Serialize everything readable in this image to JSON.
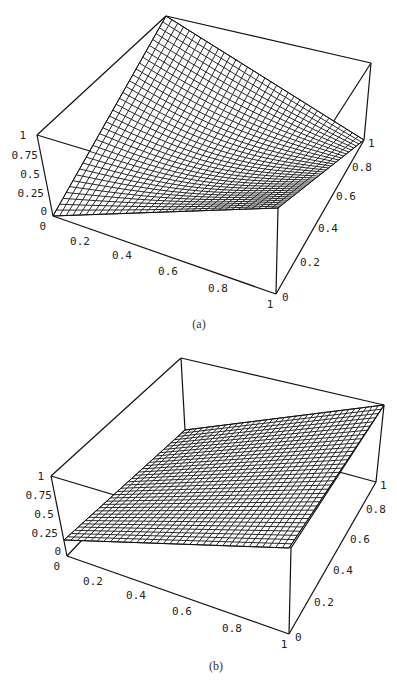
{
  "figure": {
    "panels": [
      {
        "caption": "(a)",
        "z_ticks": [
          "1",
          "0.75",
          "0.5",
          "0.25",
          "0"
        ],
        "x_ticks": [
          "0",
          "0.2",
          "0.4",
          "0.6",
          "0.8",
          "1"
        ],
        "y_ticks": [
          "0",
          "0.2",
          "0.4",
          "0.6",
          "0.8",
          "1"
        ]
      },
      {
        "caption": "(b)",
        "z_ticks": [
          "1",
          "0.75",
          "0.5",
          "0.25",
          "0"
        ],
        "x_ticks": [
          "0",
          "0.2",
          "0.4",
          "0.6",
          "0.8",
          "1"
        ],
        "y_ticks": [
          "0",
          "0.2",
          "0.4",
          "0.6",
          "0.8",
          "1"
        ]
      }
    ]
  },
  "chart_data": [
    {
      "type": "surface",
      "title": "(a)",
      "xlabel": "",
      "ylabel": "",
      "zlabel": "",
      "xlim": [
        0,
        1
      ],
      "ylim": [
        0,
        1
      ],
      "zlim": [
        0,
        1
      ],
      "x_ticks": [
        0,
        0.2,
        0.4,
        0.6,
        0.8,
        1
      ],
      "y_ticks": [
        0,
        0.2,
        0.4,
        0.6,
        0.8,
        1
      ],
      "z_ticks": [
        0,
        0.25,
        0.5,
        0.75,
        1
      ],
      "corner_values": {
        "x0_y0": 0,
        "x1_y0": 0.2,
        "x0_y1": 1,
        "x1_y1": 0.55
      },
      "description": "Wireframe mesh surface rising from 0 at (0,0) to 1 at (0,1), sagging toward the x=1 side"
    },
    {
      "type": "surface",
      "title": "(b)",
      "xlabel": "",
      "ylabel": "",
      "zlabel": "",
      "xlim": [
        0,
        1
      ],
      "ylim": [
        0,
        1
      ],
      "zlim": [
        0,
        1
      ],
      "x_ticks": [
        0,
        0.2,
        0.4,
        0.6,
        0.8,
        1
      ],
      "y_ticks": [
        0,
        0.2,
        0.4,
        0.6,
        0.8,
        1
      ],
      "z_ticks": [
        0,
        0.25,
        0.5,
        0.75,
        1
      ],
      "corner_values": {
        "x0_y0": 0.1,
        "x1_y0": 0.15,
        "x0_y1": 0.2,
        "x1_y1": 1
      },
      "description": "Wireframe mesh surface nearly flat and low, rising linearly to 1 at (1,1)"
    }
  ]
}
